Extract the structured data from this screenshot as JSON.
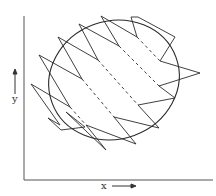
{
  "figure": {
    "axes": {
      "x_label": "x",
      "y_label": "y",
      "x_arrow": "right-arrow",
      "y_arrow": "up-arrow"
    },
    "elements": {
      "ellipse": {
        "cx": 114,
        "cy": 80,
        "rx": 66,
        "ry": 59,
        "rotation_deg": -20
      },
      "zigzag_trajectory": "sawtooth path oscillating around ellipse",
      "dashed_segments": 5
    },
    "colors": {
      "stroke": "#2a2a2a",
      "background": "#ffffff"
    }
  }
}
